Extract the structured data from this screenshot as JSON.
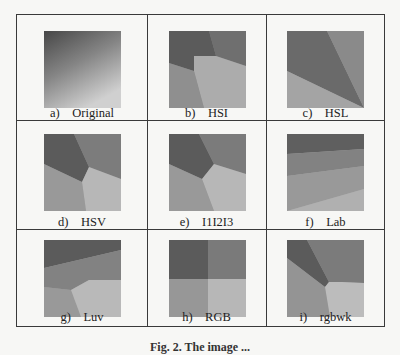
{
  "figure": {
    "panels": [
      {
        "letter": "a)",
        "name": "Original"
      },
      {
        "letter": "b)",
        "name": "HSI"
      },
      {
        "letter": "c)",
        "name": "HSL"
      },
      {
        "letter": "d)",
        "name": "HSV"
      },
      {
        "letter": "e)",
        "name": "I1I2I3"
      },
      {
        "letter": "f)",
        "name": "Lab"
      },
      {
        "letter": "g)",
        "name": "Luv"
      },
      {
        "letter": "h)",
        "name": "RGB"
      },
      {
        "letter": "i)",
        "name": "rgbwk"
      }
    ],
    "caption": "Fig. 2. The image ... "
  },
  "colors": {
    "dark": "#5b5b5b",
    "mid": "#7e7e7e",
    "midlight": "#9b9b9b",
    "light": "#bababa",
    "border": "#3a3a3a"
  }
}
